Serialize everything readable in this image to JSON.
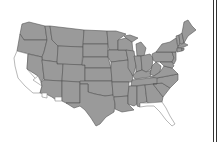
{
  "map": {
    "type": "choropleth",
    "region": "Contiguous United States",
    "colors": {
      "filled": "#9a9a9a",
      "unfilled": "#ffffff",
      "border": "#555555",
      "frame": "#333333"
    },
    "unfilled_states": [
      "California",
      "Florida",
      "Southern Arizona border areas",
      "Southern Nevada"
    ],
    "filled_states": "All other contiguous states"
  },
  "frame": {
    "lines": 2
  }
}
